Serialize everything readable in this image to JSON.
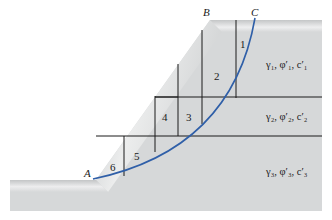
{
  "diagram": {
    "type": "slope-stability-method-of-slices",
    "points": [
      {
        "label": "A",
        "x": 88,
        "y": 177
      },
      {
        "label": "B",
        "x": 206,
        "y": 17
      },
      {
        "label": "C",
        "x": 254,
        "y": 17
      }
    ],
    "slices": [
      {
        "number": "1",
        "x": 240,
        "y": 46
      },
      {
        "number": "2",
        "x": 218,
        "y": 78
      },
      {
        "number": "3",
        "x": 189,
        "y": 121
      },
      {
        "number": "4",
        "x": 164,
        "y": 121
      },
      {
        "number": "5",
        "x": 136,
        "y": 160
      },
      {
        "number": "6",
        "x": 113,
        "y": 171
      }
    ],
    "layers": [
      {
        "label": "γ₁, φ′₁, c′₁",
        "x": 266,
        "y": 68
      },
      {
        "label": "γ₂, φ′₂, c′₂",
        "x": 266,
        "y": 120
      },
      {
        "label": "γ₃, φ′₃, c′₃",
        "x": 266,
        "y": 175
      }
    ],
    "colors": {
      "soil_fill": "#d6d8d9",
      "soil_edge_highlight": "#f2f3f3",
      "grid_line": "#1a1a1a",
      "failure_surface": "#2f5fa8"
    }
  }
}
